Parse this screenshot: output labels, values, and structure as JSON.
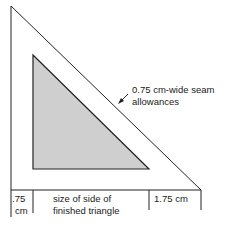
{
  "diagram": {
    "callout": {
      "line1": "0.75 cm-wide seam",
      "line2": "allowances"
    },
    "dimensions": {
      "left_line1": ".75",
      "left_line2": "cm",
      "middle_line1": "size of side of",
      "middle_line2": "finished triangle",
      "right": "1.75 cm"
    },
    "colors": {
      "outline": "#222222",
      "inner_fill": "#cfcfcf"
    }
  }
}
